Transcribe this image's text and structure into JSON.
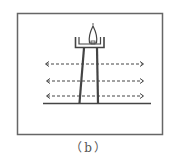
{
  "figure": {
    "caption": "（b）",
    "colors": {
      "stroke": "#444444",
      "frame": "#666666",
      "background": "#ffffff"
    },
    "arrow_rows": [
      {
        "y": 64,
        "style": "dashed",
        "direction": "bidirectional"
      },
      {
        "y": 81,
        "style": "dashed",
        "direction": "bidirectional"
      },
      {
        "y": 96,
        "style": "dashed",
        "direction": "bidirectional"
      }
    ]
  }
}
